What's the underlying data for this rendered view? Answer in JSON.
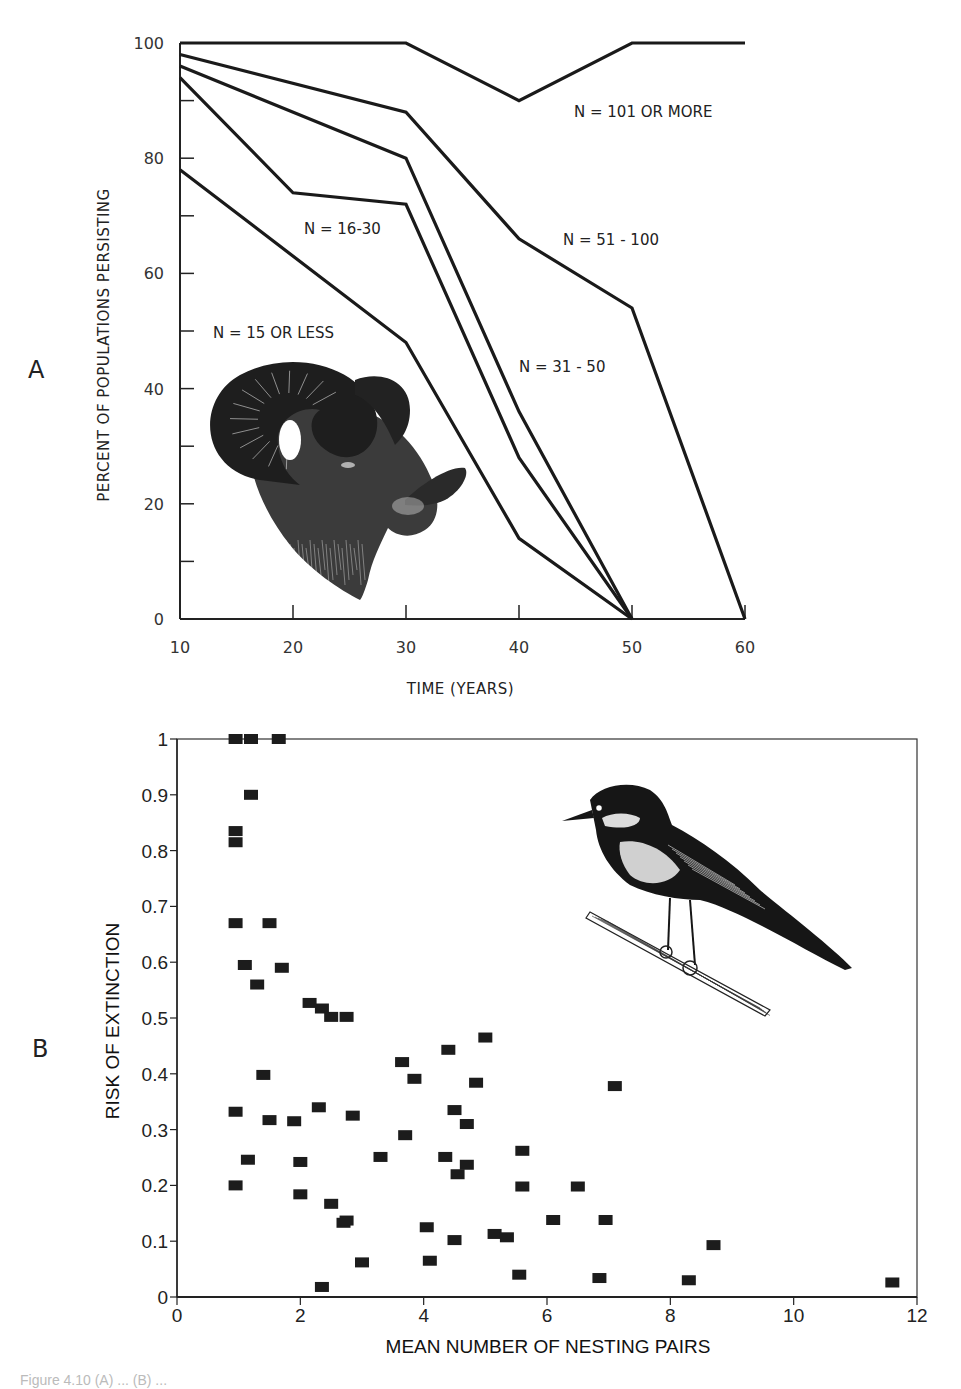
{
  "panels": {
    "a_letter": "A",
    "b_letter": "B"
  },
  "chart_data": [
    {
      "id": "A",
      "type": "line",
      "title": "",
      "xlabel": "TIME  (YEARS)",
      "ylabel": "PERCENT  OF  POPULATIONS  PERSISTING",
      "xlim": [
        10,
        60
      ],
      "ylim": [
        0,
        100
      ],
      "xticks": [
        10,
        20,
        30,
        40,
        50,
        60
      ],
      "yticks": [
        0,
        20,
        40,
        60,
        80,
        100
      ],
      "yminor": [
        10,
        30,
        50,
        70,
        90
      ],
      "grid": false,
      "legend": "inline labels",
      "illustration": "bighorn-ram-head",
      "series": [
        {
          "name": "N = 101 OR MORE",
          "x": [
            10,
            30,
            40,
            50,
            60
          ],
          "y": [
            100,
            100,
            90,
            100,
            100
          ],
          "label_pos": [
            574,
            117
          ]
        },
        {
          "name": "N = 51 - 100",
          "x": [
            10,
            30,
            40,
            50,
            60
          ],
          "y": [
            98,
            88,
            66,
            54,
            0
          ],
          "label_pos": [
            563,
            245
          ]
        },
        {
          "name": "N = 31 - 50",
          "x": [
            10,
            30,
            40,
            50
          ],
          "y": [
            96,
            80,
            36,
            0
          ],
          "label_pos": [
            519,
            372
          ]
        },
        {
          "name": "N = 16-30",
          "x": [
            10,
            20,
            30,
            40,
            50
          ],
          "y": [
            94,
            74,
            72,
            28,
            0
          ],
          "label_pos": [
            304,
            234
          ]
        },
        {
          "name": "N = 15 OR LESS",
          "x": [
            10,
            30,
            40,
            50
          ],
          "y": [
            78,
            48,
            14,
            0
          ],
          "label_pos": [
            213,
            338
          ]
        }
      ]
    },
    {
      "id": "B",
      "type": "scatter",
      "title": "",
      "xlabel": "MEAN NUMBER OF NESTING PAIRS",
      "ylabel": "RISK OF EXTINCTION",
      "xlim": [
        0,
        12
      ],
      "ylim": [
        0,
        1
      ],
      "xticks": [
        0,
        2,
        4,
        6,
        8,
        10,
        12
      ],
      "yticks": [
        0,
        0.1,
        0.2,
        0.3,
        0.4,
        0.5,
        0.6,
        0.7,
        0.8,
        0.9,
        1
      ],
      "ytick_labels": [
        "0",
        "0.1",
        "0.2",
        "0.3",
        "0.4",
        "0.5",
        "0.6",
        "0.7",
        "0.8",
        "0.9",
        "1"
      ],
      "grid": false,
      "legend": "none",
      "illustration": "songbird-on-branch",
      "points": [
        [
          0.95,
          1.0
        ],
        [
          1.2,
          1.0
        ],
        [
          1.65,
          1.0
        ],
        [
          1.2,
          0.9
        ],
        [
          0.95,
          0.835
        ],
        [
          0.95,
          0.815
        ],
        [
          0.95,
          0.67
        ],
        [
          1.5,
          0.67
        ],
        [
          1.1,
          0.595
        ],
        [
          1.7,
          0.59
        ],
        [
          1.3,
          0.56
        ],
        [
          2.15,
          0.527
        ],
        [
          2.35,
          0.517
        ],
        [
          2.5,
          0.502
        ],
        [
          2.75,
          0.502
        ],
        [
          1.4,
          0.398
        ],
        [
          0.95,
          0.332
        ],
        [
          1.5,
          0.317
        ],
        [
          1.9,
          0.315
        ],
        [
          2.3,
          0.34
        ],
        [
          2.85,
          0.325
        ],
        [
          1.15,
          0.246
        ],
        [
          2.0,
          0.242
        ],
        [
          0.95,
          0.2
        ],
        [
          2.0,
          0.184
        ],
        [
          2.5,
          0.167
        ],
        [
          2.7,
          0.133
        ],
        [
          2.75,
          0.137
        ],
        [
          3.0,
          0.062
        ],
        [
          2.35,
          0.018
        ],
        [
          3.3,
          0.251
        ],
        [
          3.65,
          0.421
        ],
        [
          3.85,
          0.391
        ],
        [
          3.7,
          0.29
        ],
        [
          4.05,
          0.125
        ],
        [
          4.1,
          0.065
        ],
        [
          4.4,
          0.443
        ],
        [
          4.5,
          0.335
        ],
        [
          4.35,
          0.251
        ],
        [
          4.55,
          0.22
        ],
        [
          4.7,
          0.31
        ],
        [
          4.7,
          0.237
        ],
        [
          4.85,
          0.384
        ],
        [
          5.0,
          0.465
        ],
        [
          4.5,
          0.102
        ],
        [
          5.15,
          0.113
        ],
        [
          5.35,
          0.107
        ],
        [
          5.6,
          0.262
        ],
        [
          5.6,
          0.198
        ],
        [
          5.55,
          0.04
        ],
        [
          6.1,
          0.138
        ],
        [
          6.5,
          0.198
        ],
        [
          6.95,
          0.138
        ],
        [
          7.1,
          0.378
        ],
        [
          6.85,
          0.034
        ],
        [
          8.3,
          0.03
        ],
        [
          8.7,
          0.093
        ],
        [
          11.6,
          0.026
        ]
      ]
    }
  ],
  "caption": "Figure 4.10   (A) ... (B) ..."
}
